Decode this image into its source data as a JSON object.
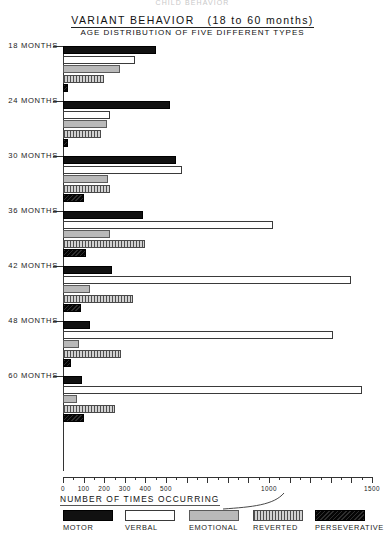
{
  "ghost_header": "CHILD BEHAVIOR",
  "title": {
    "main": "VARIANT  BEHAVIOR",
    "main_paren": "(18 to 60  months)",
    "sub": "AGE  DISTRIBUTION OF FIVE  DIFFERENT   TYPES"
  },
  "axis": {
    "title": "NUMBER  OF  TIMES  OCCURRING",
    "labels": [
      "0",
      "100",
      "200",
      "300",
      "400",
      "500",
      "1000",
      "1500"
    ],
    "label_values": [
      0,
      100,
      200,
      300,
      400,
      500,
      1000,
      1500
    ],
    "major_ticks": [
      0,
      100,
      200,
      300,
      400,
      500,
      600,
      700,
      800,
      900,
      1000,
      1100,
      1200,
      1300,
      1400,
      1500
    ],
    "minor_ticks": [
      50,
      150,
      250,
      350,
      450,
      550,
      650,
      750,
      850,
      950,
      1050,
      1150,
      1250,
      1350,
      1450
    ],
    "min": 0,
    "max": 1500
  },
  "legend": [
    {
      "key": "motor",
      "label": "MOTOR",
      "pattern": "solid-black"
    },
    {
      "key": "verbal",
      "label": "VERBAL",
      "pattern": "white-outline"
    },
    {
      "key": "emotional",
      "label": "EMOTIONAL",
      "pattern": "gray-stipple"
    },
    {
      "key": "reverted",
      "label": "REVERTED",
      "pattern": "vertical-hatch"
    },
    {
      "key": "perseverative",
      "label": "PERSEVERATIVE",
      "pattern": "dark-hatch"
    }
  ],
  "groups": [
    {
      "label": "18 MONTHS"
    },
    {
      "label": "24 MONTHS"
    },
    {
      "label": "30 MONTHS"
    },
    {
      "label": "36 MONTHS"
    },
    {
      "label": "42 MONTHS"
    },
    {
      "label": "48 MONTHS"
    },
    {
      "label": "60 MONTHS"
    }
  ],
  "chart_data": {
    "type": "bar",
    "orientation": "horizontal",
    "subtitle": "AGE DISTRIBUTION OF FIVE DIFFERENT TYPES",
    "xlabel": "NUMBER OF TIMES OCCURRING",
    "ylabel": "",
    "xlim": [
      0,
      1500
    ],
    "grid": false,
    "legend_position": "bottom",
    "categories": [
      "18 MONTHS",
      "24 MONTHS",
      "30 MONTHS",
      "36 MONTHS",
      "42 MONTHS",
      "48 MONTHS",
      "60 MONTHS"
    ],
    "series": [
      {
        "name": "MOTOR",
        "values": [
          450,
          520,
          550,
          390,
          240,
          130,
          90
        ]
      },
      {
        "name": "VERBAL",
        "values": [
          350,
          230,
          580,
          1020,
          1400,
          1310,
          1450
        ]
      },
      {
        "name": "EMOTIONAL",
        "values": [
          275,
          215,
          220,
          230,
          130,
          80,
          70
        ]
      },
      {
        "name": "REVERTED",
        "values": [
          200,
          185,
          230,
          400,
          340,
          280,
          250
        ]
      },
      {
        "name": "PERSEVERATIVE",
        "values": [
          25,
          25,
          100,
          110,
          85,
          40,
          100
        ]
      }
    ]
  }
}
